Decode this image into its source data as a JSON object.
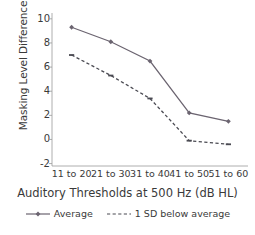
{
  "chart_data": {
    "type": "line",
    "title": "",
    "xlabel": "Auditory Thresholds at 500 Hz (dB HL)",
    "ylabel": "Masking Level Difference (dB)",
    "categories": [
      "11 to 20",
      "21 to 30",
      "31 to 40",
      "41 to 50",
      "51 to 60"
    ],
    "series": [
      {
        "name": "Average",
        "values": [
          9.3,
          8.1,
          6.5,
          2.2,
          1.5
        ],
        "style": "solid",
        "marker": "diamond",
        "color": "#6b6470"
      },
      {
        "name": "1 SD below average",
        "values": [
          7.0,
          5.3,
          3.4,
          -0.1,
          -0.4
        ],
        "style": "dashed",
        "marker": "dash",
        "color": "#4a4a52"
      }
    ],
    "ylim": [
      -2,
      10
    ],
    "yticks": [
      10,
      8,
      6,
      4,
      2,
      0,
      -2
    ],
    "ytick_labels": [
      "10",
      "8",
      "6",
      "4",
      "2",
      "0",
      "-2"
    ],
    "grid": false,
    "legend_position": "bottom",
    "axis_color": "#9a9a9a"
  },
  "legend": {
    "entries": [
      {
        "label": "Average"
      },
      {
        "label": "1 SD below average"
      }
    ]
  }
}
